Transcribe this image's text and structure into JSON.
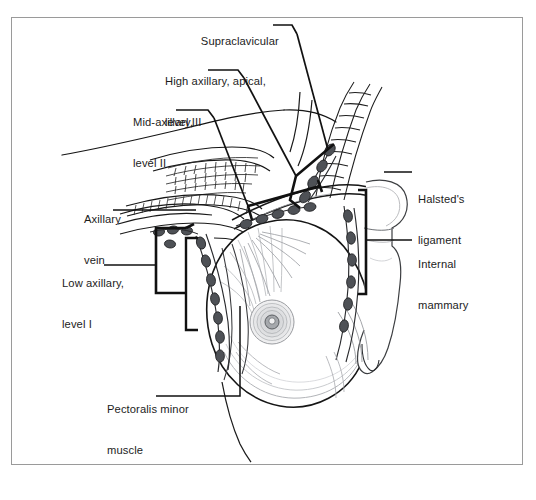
{
  "figure": {
    "type": "anatomical-illustration",
    "background_color": "#ffffff",
    "frame_color": "#9a9a9a",
    "ink_color": "#111111",
    "node_fill_color": "#5f6166",
    "shading_color": "#8d9095"
  },
  "labels": [
    {
      "id": "supraclavicular",
      "text": "Supraclavicular",
      "x": 188,
      "y": 21,
      "align": "left"
    },
    {
      "id": "high-axillary-level-3",
      "text": "High axillary, apical,\nlevel III",
      "line1": "High axillary, apical,",
      "line2": "level III",
      "x": 165,
      "y": 48,
      "align": "left"
    },
    {
      "id": "mid-axillary-level-2",
      "text": "Mid-axillary,\nlevel II",
      "line1": "Mid-axillary,",
      "line2": "level II",
      "x": 133,
      "y": 89,
      "align": "left"
    },
    {
      "id": "axillary-vein",
      "text": "Axillary\nvein",
      "line1": "Axillary",
      "line2": "vein",
      "x": 84,
      "y": 186,
      "align": "left"
    },
    {
      "id": "low-axillary-level-1",
      "text": "Low axillary,\nlevel I",
      "line1": "Low axillary,",
      "line2": "level I",
      "x": 62,
      "y": 250,
      "align": "left"
    },
    {
      "id": "pectoralis-minor-muscle",
      "text": "Pectoralis minor\nmuscle",
      "line1": "Pectoralis minor",
      "line2": "muscle",
      "x": 107,
      "y": 376,
      "align": "left"
    },
    {
      "id": "halsteds-ligament",
      "text": "Halsted's\nligament",
      "line1": "Halsted's",
      "line2": "ligament",
      "x": 418,
      "y": 166,
      "align": "left"
    },
    {
      "id": "internal-mammary",
      "text": "Internal\nmammary",
      "line1": "Internal",
      "line2": "mammary",
      "x": 418,
      "y": 231,
      "align": "left"
    }
  ]
}
